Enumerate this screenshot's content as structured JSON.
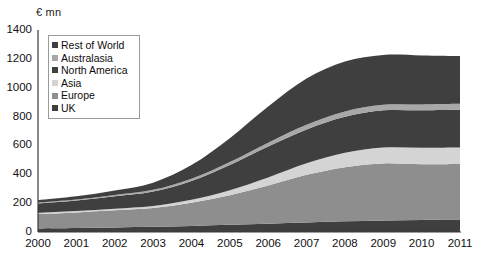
{
  "axis_unit_label": "€ mn",
  "legend": {
    "items": [
      {
        "label": "Rest of World",
        "color": "#3f3f3f"
      },
      {
        "label": "Australasia",
        "color": "#a8a8a8"
      },
      {
        "label": "North America",
        "color": "#3f3f3f"
      },
      {
        "label": "Asia",
        "color": "#d4d4d4"
      },
      {
        "label": "Europe",
        "color": "#8e8e8e"
      },
      {
        "label": "UK",
        "color": "#3f3f3f"
      }
    ]
  },
  "yticks": [
    "0",
    "200",
    "400",
    "600",
    "800",
    "1000",
    "1200",
    "1400"
  ],
  "xticks": [
    "2000",
    "2001",
    "2002",
    "2003",
    "2004",
    "2005",
    "2006",
    "2007",
    "2008",
    "2009",
    "2010",
    "2011"
  ],
  "chart_data": {
    "type": "area",
    "stacked": true,
    "title": "",
    "subtitle": "",
    "xlabel": "",
    "ylabel": "€ mn",
    "ylim": [
      0,
      1400
    ],
    "ytick_step": 200,
    "grid": false,
    "legend_position": "inside-top-left",
    "categories": [
      "2000",
      "2001",
      "2002",
      "2003",
      "2004",
      "2005",
      "2006",
      "2007",
      "2008",
      "2009",
      "2010",
      "2011"
    ],
    "series": [
      {
        "name": "UK",
        "color": "#3f3f3f",
        "values": [
          25,
          28,
          32,
          36,
          42,
          50,
          58,
          66,
          74,
          80,
          84,
          86
        ]
      },
      {
        "name": "Europe",
        "color": "#8e8e8e",
        "values": [
          100,
          108,
          118,
          130,
          160,
          205,
          265,
          330,
          375,
          395,
          385,
          385
        ]
      },
      {
        "name": "Asia",
        "color": "#d4d4d4",
        "values": [
          8,
          10,
          12,
          15,
          22,
          35,
          55,
          80,
          100,
          110,
          115,
          115
        ]
      },
      {
        "name": "North America",
        "color": "#3f3f3f",
        "values": [
          65,
          72,
          85,
          100,
          130,
          175,
          215,
          235,
          250,
          258,
          260,
          262
        ]
      },
      {
        "name": "Australasia",
        "color": "#a8a8a8",
        "values": [
          6,
          7,
          9,
          11,
          15,
          20,
          26,
          32,
          37,
          39,
          40,
          40
        ]
      },
      {
        "name": "Rest of World",
        "color": "#3f3f3f",
        "values": [
          16,
          22,
          32,
          50,
          95,
          165,
          250,
          320,
          345,
          345,
          340,
          332
        ]
      }
    ],
    "cumulative_top_values": [
      220,
      247,
      288,
      342,
      464,
      650,
      869,
      1063,
      1181,
      1227,
      1224,
      1220
    ]
  }
}
